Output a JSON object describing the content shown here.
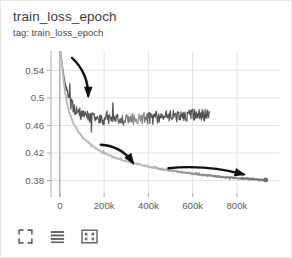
{
  "header": {
    "title": "train_loss_epoch",
    "subtitle": "tag: train_loss_epoch"
  },
  "toolbar": {
    "buttons": [
      {
        "name": "expand-icon",
        "label": "Expand chart"
      },
      {
        "name": "lines-icon",
        "label": "Toggle data table"
      },
      {
        "name": "fit-domain-icon",
        "label": "Fit domain to data"
      }
    ]
  },
  "colors": {
    "background": "#ffffff",
    "border": "#e6e6e6",
    "grid": "#dde3ea",
    "axis": "#aaaaaa",
    "tick_text": "#5a5a5a",
    "title_text": "#3c3c3c",
    "series_noisy": "#555555",
    "series_noisy_light": "#9a9a9a",
    "series_smooth_light": "#b9b9b9",
    "series_smooth_dark": "#6e6e6e",
    "annotation": "#111111"
  },
  "chart_data": {
    "type": "line",
    "title": "train_loss_epoch",
    "subtitle": "tag: train_loss_epoch",
    "xlabel": "",
    "ylabel": "",
    "xlim": [
      -40000,
      990000
    ],
    "ylim": [
      0.362,
      0.568
    ],
    "grid": true,
    "legend": "none",
    "xticks": [
      0,
      200000,
      400000,
      600000,
      800000
    ],
    "xtick_labels": [
      "0",
      "200k",
      "400k",
      "600k",
      "800k"
    ],
    "yticks": [
      0.38,
      0.42,
      0.46,
      0.5,
      0.54
    ],
    "ytick_labels": [
      "0.38",
      "0.42",
      "0.46",
      "0.5",
      "0.54"
    ],
    "series": [
      {
        "name": "run-a-noisy",
        "color": "#555555",
        "noise": 0.0085,
        "x": [
          3000,
          8000,
          15000,
          25000,
          40000,
          60000,
          85000,
          110000,
          140000,
          175000,
          210000,
          250000,
          290000,
          330000,
          375000,
          420000,
          465000,
          510000,
          555000,
          600000,
          640000,
          675000
        ],
        "y": [
          0.567,
          0.556,
          0.537,
          0.515,
          0.497,
          0.485,
          0.477,
          0.473,
          0.47,
          0.468,
          0.467,
          0.467,
          0.467,
          0.468,
          0.469,
          0.47,
          0.471,
          0.472,
          0.473,
          0.474,
          0.474,
          0.473
        ]
      },
      {
        "name": "run-b-smooth",
        "color": "#9a9a9a",
        "noise": 0.0009,
        "x": [
          3000,
          8000,
          15000,
          25000,
          40000,
          60000,
          85000,
          110000,
          140000,
          175000,
          210000,
          250000,
          290000,
          330000,
          375000,
          420000,
          465000,
          510000,
          555000,
          600000,
          645000,
          690000,
          735000,
          780000,
          825000,
          870000,
          905000,
          930000
        ],
        "y": [
          0.567,
          0.553,
          0.531,
          0.505,
          0.481,
          0.464,
          0.45,
          0.441,
          0.432,
          0.424,
          0.418,
          0.413,
          0.409,
          0.405,
          0.402,
          0.399,
          0.396,
          0.394,
          0.392,
          0.39,
          0.388,
          0.387,
          0.385,
          0.384,
          0.383,
          0.382,
          0.381,
          0.381
        ]
      }
    ],
    "annotations": [
      {
        "name": "arrow-top",
        "kind": "curved-arrow",
        "from_x": 55000,
        "from_y": 0.558,
        "to_x": 128000,
        "to_y": 0.503
      },
      {
        "name": "arrow-middle",
        "kind": "curved-arrow",
        "from_x": 185000,
        "from_y": 0.432,
        "to_x": 330000,
        "to_y": 0.406
      },
      {
        "name": "arrow-bottom",
        "kind": "curved-arrow",
        "from_x": 490000,
        "from_y": 0.398,
        "to_x": 830000,
        "to_y": 0.389
      }
    ]
  }
}
